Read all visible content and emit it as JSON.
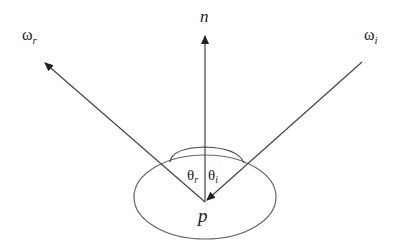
{
  "diagram": {
    "labels": {
      "normal": "n",
      "reflected_dir": "ω",
      "reflected_sub": "r",
      "incident_dir": "ω",
      "incident_sub": "i",
      "theta_r": "θ",
      "theta_r_sub": "r",
      "theta_i": "θ",
      "theta_i_sub": "i",
      "point": "p"
    },
    "colors": {
      "stroke": "#444444",
      "arrow": "#222222",
      "ellipse": "#666666",
      "text": "#222222",
      "background": "#ffffff"
    }
  }
}
